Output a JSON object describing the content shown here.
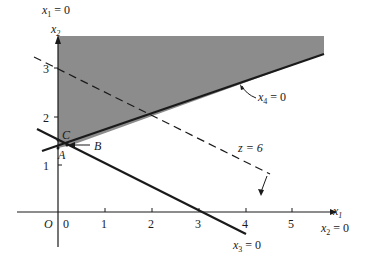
{
  "diagram": {
    "type": "linear-programming-feasible-region",
    "axes": {
      "x_label": "x",
      "x_label_sub": "1",
      "y_label": "x",
      "y_label_sub": "2",
      "origin_label": "O",
      "x_ticks": [
        "0",
        "1",
        "2",
        "3",
        "4",
        "5"
      ],
      "y_ticks": [
        "1",
        "2",
        "3"
      ]
    },
    "constraint_labels": {
      "x1_zero": {
        "var": "x",
        "sub": "1",
        "rest": " = 0"
      },
      "x2_zero": {
        "var": "x",
        "sub": "2",
        "rest": " = 0"
      },
      "x3_zero": {
        "var": "x",
        "sub": "3",
        "rest": " = 0"
      },
      "x4_zero": {
        "var": "x",
        "sub": "4",
        "rest": " = 0"
      }
    },
    "objective_label": "z = 6",
    "points": {
      "A": "A",
      "B": "B",
      "C": "C"
    },
    "colors": {
      "feasible_region": "#8c8c8c",
      "lines": "#1a1a1a",
      "background": "#ffffff"
    }
  }
}
